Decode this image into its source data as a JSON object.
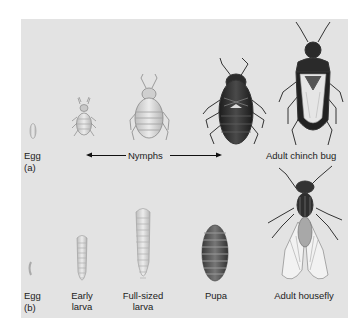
{
  "figure": {
    "panel_a": {
      "tag": "(a)",
      "labels": {
        "egg": "Egg",
        "nymphs": "Nymphs",
        "adult": "Adult chinch bug"
      },
      "stages": [
        "Egg",
        "Nymph (small)",
        "Nymph (medium)",
        "Nymph (large)",
        "Adult chinch bug"
      ]
    },
    "panel_b": {
      "tag": "(b)",
      "labels": {
        "egg": "Egg",
        "early_larva_1": "Early",
        "early_larva_2": "larva",
        "full_larva_1": "Full-sized",
        "full_larva_2": "larva",
        "pupa": "Pupa",
        "adult": "Adult housefly"
      }
    },
    "colors": {
      "panel_bg": "#e3e3e3",
      "page_bg": "#ffffff",
      "dark_insect": "#2a2a2a",
      "light_insect": "#cfcfcf"
    }
  }
}
